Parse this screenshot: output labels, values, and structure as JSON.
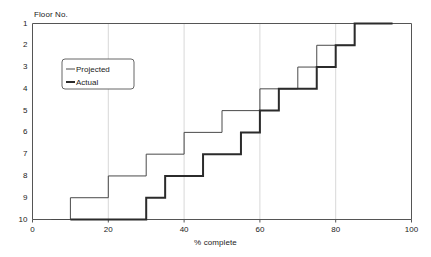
{
  "chart_data": {
    "type": "line",
    "subtype": "step",
    "title": "",
    "xlabel": "% complete",
    "ylabel": "Floor No.",
    "xlim": [
      0,
      100
    ],
    "ylim": [
      10,
      1
    ],
    "y_inverted": true,
    "grid": "vertical-only",
    "x_ticks": [
      0,
      20,
      40,
      60,
      80,
      100
    ],
    "y_ticks": [
      1,
      2,
      3,
      4,
      5,
      6,
      7,
      8,
      9,
      10
    ],
    "x_tick_labels": [
      "0",
      "20",
      "40",
      "60",
      "80",
      "100"
    ],
    "y_tick_labels": [
      "1",
      "2",
      "3",
      "4",
      "5",
      "6",
      "7",
      "8",
      "9",
      "10"
    ],
    "legend": {
      "position": "upper-left-inside",
      "entries": [
        "Projected",
        "Actual"
      ]
    },
    "series": [
      {
        "name": "Projected",
        "style": "thin",
        "color": "#4a4a4a",
        "width": 1,
        "points": [
          {
            "x": 5,
            "floor": 10
          },
          {
            "x": 10,
            "floor": 10
          },
          {
            "x": 10,
            "floor": 9
          },
          {
            "x": 20,
            "floor": 9
          },
          {
            "x": 20,
            "floor": 8
          },
          {
            "x": 30,
            "floor": 8
          },
          {
            "x": 30,
            "floor": 7
          },
          {
            "x": 40,
            "floor": 7
          },
          {
            "x": 40,
            "floor": 6
          },
          {
            "x": 50,
            "floor": 6
          },
          {
            "x": 50,
            "floor": 5
          },
          {
            "x": 60,
            "floor": 5
          },
          {
            "x": 60,
            "floor": 4
          },
          {
            "x": 70,
            "floor": 4
          },
          {
            "x": 70,
            "floor": 3
          },
          {
            "x": 75,
            "floor": 3
          },
          {
            "x": 75,
            "floor": 2
          },
          {
            "x": 85,
            "floor": 2
          },
          {
            "x": 85,
            "floor": 1
          },
          {
            "x": 95,
            "floor": 1
          }
        ]
      },
      {
        "name": "Actual",
        "style": "thick",
        "color": "#2b2b2b",
        "width": 2,
        "points": [
          {
            "x": 10,
            "floor": 10
          },
          {
            "x": 30,
            "floor": 10
          },
          {
            "x": 30,
            "floor": 9
          },
          {
            "x": 35,
            "floor": 9
          },
          {
            "x": 35,
            "floor": 8
          },
          {
            "x": 45,
            "floor": 8
          },
          {
            "x": 45,
            "floor": 7
          },
          {
            "x": 55,
            "floor": 7
          },
          {
            "x": 55,
            "floor": 6
          },
          {
            "x": 60,
            "floor": 6
          },
          {
            "x": 60,
            "floor": 5
          },
          {
            "x": 65,
            "floor": 5
          },
          {
            "x": 65,
            "floor": 4
          },
          {
            "x": 75,
            "floor": 4
          },
          {
            "x": 75,
            "floor": 3
          },
          {
            "x": 80,
            "floor": 3
          },
          {
            "x": 80,
            "floor": 2
          },
          {
            "x": 85,
            "floor": 2
          },
          {
            "x": 85,
            "floor": 1
          },
          {
            "x": 95,
            "floor": 1
          }
        ]
      }
    ]
  },
  "axes": {
    "y_title": "Floor No.",
    "x_title": "% complete"
  },
  "legend": {
    "projected_label": "Projected",
    "actual_label": "Actual"
  },
  "colors": {
    "axis": "#555555",
    "grid": "#d8d8d8",
    "projected": "#4a4a4a",
    "actual": "#2b2b2b",
    "text": "#1a1a1a",
    "background": "#ffffff"
  }
}
